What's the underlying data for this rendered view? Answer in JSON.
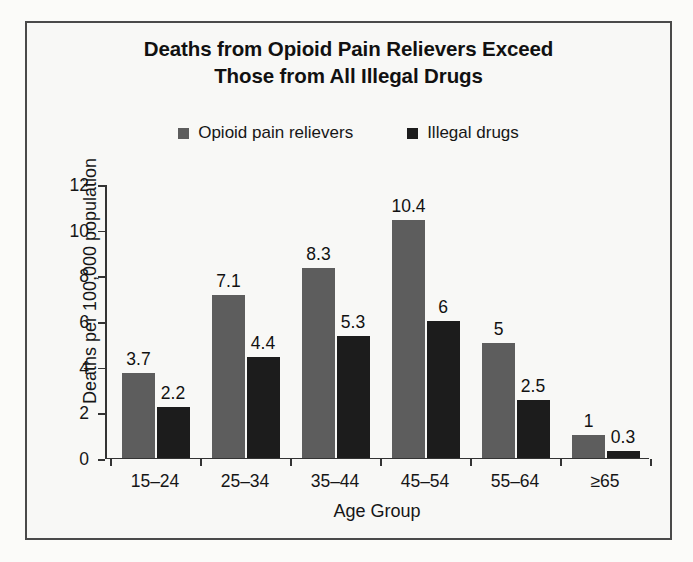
{
  "chart_data": {
    "type": "bar",
    "title": "Deaths from Opioid Pain Relievers Exceed Those from All Illegal Drugs",
    "title_line1": "Deaths from Opioid Pain Relievers Exceed",
    "title_line2": "Those from All Illegal Drugs",
    "xlabel": "Age Group",
    "ylabel": "Deaths per 100,000 population",
    "categories": [
      "15–24",
      "25–34",
      "35–44",
      "45–54",
      "55–64",
      "≥65"
    ],
    "series": [
      {
        "name": "Opioid pain relievers",
        "color": "#5d5d5d",
        "values": [
          3.7,
          7.1,
          8.3,
          10.4,
          5,
          1
        ],
        "labels": [
          "3.7",
          "7.1",
          "8.3",
          "10.4",
          "5",
          "1"
        ]
      },
      {
        "name": "Illegal drugs",
        "color": "#1c1c1c",
        "values": [
          2.2,
          4.4,
          5.3,
          6,
          2.5,
          0.3
        ],
        "labels": [
          "2.2",
          "4.4",
          "5.3",
          "6",
          "2.5",
          "0.3"
        ]
      }
    ],
    "ylim": [
      0,
      12
    ],
    "yticks": [
      0,
      2,
      4,
      6,
      8,
      10,
      12
    ],
    "ytick_labels": [
      "0",
      "2",
      "4",
      "6",
      "8",
      "10",
      "12"
    ],
    "grid": false,
    "legend_position": "top-center"
  },
  "legend": {
    "items": [
      {
        "label": "Opioid pain relievers",
        "color": "#5d5d5d"
      },
      {
        "label": "Illegal drugs",
        "color": "#1c1c1c"
      }
    ]
  },
  "colors": {
    "frame_border": "#4a4a4a",
    "background": "#f8f8f6",
    "axis": "#333333",
    "text": "#161616",
    "series_1": "#5d5d5d",
    "series_2": "#1c1c1c"
  }
}
